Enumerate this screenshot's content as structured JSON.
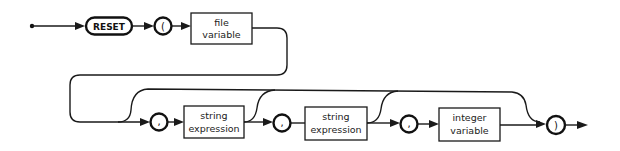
{
  "diagram": {
    "type": "syntax-railroad",
    "statement": "RESET",
    "nodes": {
      "reset": {
        "label": "RESET",
        "kind": "terminal-keyword"
      },
      "open_paren": {
        "label": "(",
        "kind": "terminal-symbol"
      },
      "file_variable": {
        "line1": "file",
        "line2": "variable",
        "kind": "nonterminal"
      },
      "comma1": {
        "label": ",",
        "kind": "terminal-symbol"
      },
      "string_expression1": {
        "line1": "string",
        "line2": "expression",
        "kind": "nonterminal"
      },
      "comma2": {
        "label": ",",
        "kind": "terminal-symbol"
      },
      "string_expression2": {
        "line1": "string",
        "line2": "expression",
        "kind": "nonterminal"
      },
      "comma3": {
        "label": ",",
        "kind": "terminal-symbol"
      },
      "integer_variable": {
        "line1": "integer",
        "line2": "variable",
        "kind": "nonterminal"
      },
      "close_paren": {
        "label": ")",
        "kind": "terminal-symbol"
      }
    },
    "sequence": [
      "start",
      "RESET",
      "(",
      "file variable",
      "[, string expression [, string expression [, integer variable]]]",
      ")",
      "end"
    ],
    "optional_groups": [
      {
        "items": [
          ", string expression"
        ],
        "bypass_to": ")"
      },
      {
        "items": [
          ", string expression"
        ],
        "bypass_to": ")"
      },
      {
        "items": [
          ", integer variable"
        ],
        "bypass_to": ")"
      }
    ],
    "colors": {
      "stroke": "#1a1a1a",
      "background": "#ffffff"
    }
  }
}
